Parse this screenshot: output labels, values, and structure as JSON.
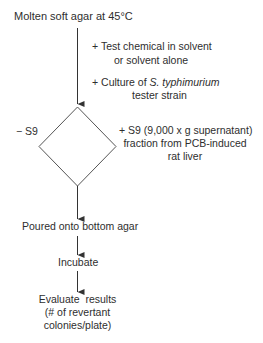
{
  "diagram": {
    "start": {
      "label": "Molten soft agar at 45°C"
    },
    "additions": [
      {
        "prefix": "+",
        "line1": "Test chemical in solvent",
        "line2": "or solvent alone"
      },
      {
        "prefix": "+",
        "line1_plain": "Culture of",
        "line1_italic": "S. typhimurium",
        "line2": "tester strain"
      }
    ],
    "decision": {
      "shape": "diamond",
      "left_branch": "− S9",
      "right_branch": {
        "line1": "+ S9 (9,000 x g supernatant)",
        "line2": "fraction from PCB-induced",
        "line3": "rat liver"
      }
    },
    "steps": [
      {
        "label": "Poured onto bottom agar"
      },
      {
        "label": "Incubate"
      },
      {
        "line1": "Evaluate  results",
        "line2": "(# of revertant",
        "line3": "colonies/plate)"
      }
    ],
    "colors": {
      "line": "#333333",
      "text": "#2e2e2e",
      "background": "#ffffff"
    }
  }
}
